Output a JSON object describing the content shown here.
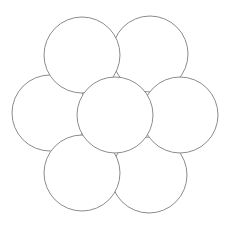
{
  "diagram": {
    "type": "flower-of-circles",
    "stroke_color": "#8c8c8c",
    "fill_color": "#ffffff",
    "background": "#ffffff",
    "radius": 38,
    "circles": [
      {
        "id": "top-right",
        "cx": 150,
        "cy": 54
      },
      {
        "id": "bottom-right",
        "cx": 149,
        "cy": 175
      },
      {
        "id": "left",
        "cx": 50,
        "cy": 113
      },
      {
        "id": "top-left",
        "cx": 82,
        "cy": 55
      },
      {
        "id": "bottom-left",
        "cx": 82,
        "cy": 173
      },
      {
        "id": "right",
        "cx": 180,
        "cy": 115
      },
      {
        "id": "center",
        "cx": 115,
        "cy": 115
      }
    ]
  }
}
